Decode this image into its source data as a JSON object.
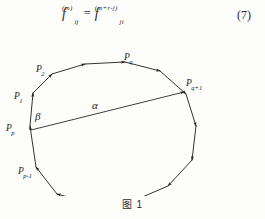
{
  "page": {
    "background_color": "#fdfdfc",
    "ink_color": "#1c1c1c"
  },
  "equation": {
    "number": "(7)",
    "lhs": {
      "base": "f",
      "subscript": "ij",
      "superscript": "(m)"
    },
    "relation": "=",
    "rhs": {
      "base": "f",
      "subscript": "ji",
      "superscript": "(m+r-j)"
    },
    "plain_text": "f_ij^(m) = f_ji^(m+r-j)"
  },
  "figure": {
    "caption": "图 1",
    "type": "polygon-diagram",
    "edge_direction": "clockwise",
    "vertex_labels": [
      {
        "id": "P1",
        "text": "P",
        "sub": "1",
        "x": 14,
        "y": 72
      },
      {
        "id": "P2",
        "text": "P",
        "sub": "2",
        "x": 38,
        "y": 45
      },
      {
        "id": "Pq",
        "text": "P",
        "sub": "q",
        "x": 125,
        "y": 38
      },
      {
        "id": "Pq1",
        "text": "P",
        "sub": "q+1",
        "x": 201,
        "y": 60
      },
      {
        "id": "Pp",
        "text": "P",
        "sub": "p",
        "x": 7,
        "y": 113
      },
      {
        "id": "Pp1",
        "text": "P",
        "sub": "p-1",
        "x": 22,
        "y": 165
      }
    ],
    "angle_labels": [
      {
        "id": "alpha",
        "glyph": "α",
        "x": 92,
        "y": 83
      },
      {
        "id": "beta",
        "glyph": "β",
        "x": 35,
        "y": 94
      }
    ],
    "polygon_vertices": [
      {
        "x": 30,
        "y": 100
      },
      {
        "x": 33,
        "y": 67
      },
      {
        "x": 52,
        "y": 48
      },
      {
        "x": 85,
        "y": 38
      },
      {
        "x": 125,
        "y": 36
      },
      {
        "x": 160,
        "y": 45
      },
      {
        "x": 186,
        "y": 68
      },
      {
        "x": 196,
        "y": 100
      },
      {
        "x": 192,
        "y": 134
      },
      {
        "x": 168,
        "y": 160
      },
      {
        "x": 133,
        "y": 175
      },
      {
        "x": 94,
        "y": 178
      },
      {
        "x": 57,
        "y": 168
      },
      {
        "x": 36,
        "y": 141
      }
    ],
    "chord": {
      "label": "α",
      "from": "Pp",
      "to": "Pq1",
      "x1": 31,
      "y1": 104,
      "x2": 184,
      "y2": 66
    }
  }
}
